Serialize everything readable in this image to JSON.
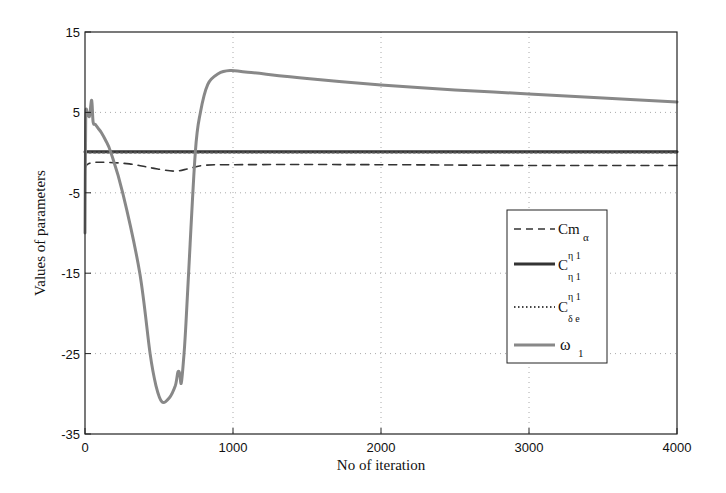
{
  "chart_data": {
    "type": "line",
    "title": "",
    "xlabel": "No of iteration",
    "ylabel": "Values of parameters",
    "xlim": [
      0,
      4000
    ],
    "ylim": [
      -35,
      15
    ],
    "xticks": [
      0,
      1000,
      2000,
      3000,
      4000
    ],
    "yticks": [
      15,
      5,
      -5,
      -15,
      -25,
      -35
    ],
    "xtick_labels": [
      "0",
      "1000",
      "2000",
      "3000",
      "4000"
    ],
    "ytick_labels": [
      "15",
      "5",
      "-5",
      "-15",
      "-25",
      "-35"
    ],
    "grid": true,
    "legend_position": "center-right",
    "series": [
      {
        "name": "Cm_alpha",
        "legend_main": "Cm",
        "legend_sub": "α",
        "style": "dashed",
        "color": "#333333",
        "x": [
          0,
          20,
          100,
          300,
          450,
          600,
          700,
          800,
          1000,
          2000,
          3000,
          4000
        ],
        "y": [
          -2.0,
          -1.4,
          -1.2,
          -1.4,
          -1.9,
          -2.3,
          -2.0,
          -1.6,
          -1.5,
          -1.5,
          -1.6,
          -1.6
        ]
      },
      {
        "name": "C_eta1^eta1",
        "legend_main": "C",
        "legend_sup": "η 1",
        "legend_sub": "η 1",
        "style": "solid",
        "color": "#333333",
        "x": [
          0,
          4000
        ],
        "y": [
          0.1,
          0.1
        ]
      },
      {
        "name": "C_delta_e^eta1",
        "legend_main": "C",
        "legend_sup": "η 1",
        "legend_sub": "δ e",
        "style": "dotted",
        "color": "#555555",
        "x": [
          0,
          4000
        ],
        "y": [
          0.0,
          0.0
        ]
      },
      {
        "name": "omega_1",
        "legend_main": "ω",
        "legend_sub": "1",
        "style": "solid",
        "color": "#888888",
        "x": [
          0,
          5,
          15,
          30,
          45,
          55,
          70,
          90,
          110,
          140,
          175,
          255,
          370,
          440,
          480,
          520,
          570,
          610,
          628,
          640,
          650,
          665,
          680,
          700,
          745,
          780,
          830,
          900,
          980,
          1100,
          1500,
          2000,
          2500,
          3000,
          3500,
          4000
        ],
        "y": [
          -10,
          4.0,
          5.0,
          4.5,
          6.5,
          3.8,
          3.5,
          3.0,
          2.5,
          1.5,
          0,
          -5,
          -15,
          -25,
          -29,
          -31,
          -30.5,
          -29,
          -27.3,
          -27.5,
          -28.7,
          -26,
          -22,
          -15,
          0,
          5,
          8.5,
          9.8,
          10.2,
          10.0,
          9.2,
          8.4,
          7.8,
          7.3,
          6.8,
          6.3
        ]
      }
    ]
  },
  "axes": {
    "xlabel": "No of iteration",
    "ylabel": "Values of parameters"
  },
  "legend": {
    "items": [
      {
        "main": "Cm",
        "sub": "α",
        "sup": ""
      },
      {
        "main": "C",
        "sub": "η 1",
        "sup": "η 1"
      },
      {
        "main": "C",
        "sub": "δ e",
        "sup": "η 1"
      },
      {
        "main": "ω",
        "sub": "1",
        "sup": ""
      }
    ]
  }
}
